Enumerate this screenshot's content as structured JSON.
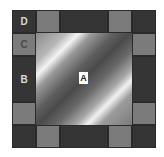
{
  "diagram": {
    "background_color": "#ffffff",
    "grid": {
      "columns": 6,
      "rows": 6
    },
    "colors": {
      "dark": "#353535",
      "gray": "#7b7b7b",
      "gradient_highlight": "#f4f4f4",
      "gradient_shadow": "#4a4a4a"
    },
    "labels": {
      "a": "A",
      "b": "B",
      "c": "C",
      "d": "D"
    },
    "regions": [
      {
        "id": "A",
        "description": "central square with diagonal banded gradient"
      },
      {
        "id": "B",
        "description": "dark left border block spanning two rows"
      },
      {
        "id": "C",
        "description": "gray left border cell"
      },
      {
        "id": "D",
        "description": "dark top-left corner cell"
      }
    ]
  }
}
